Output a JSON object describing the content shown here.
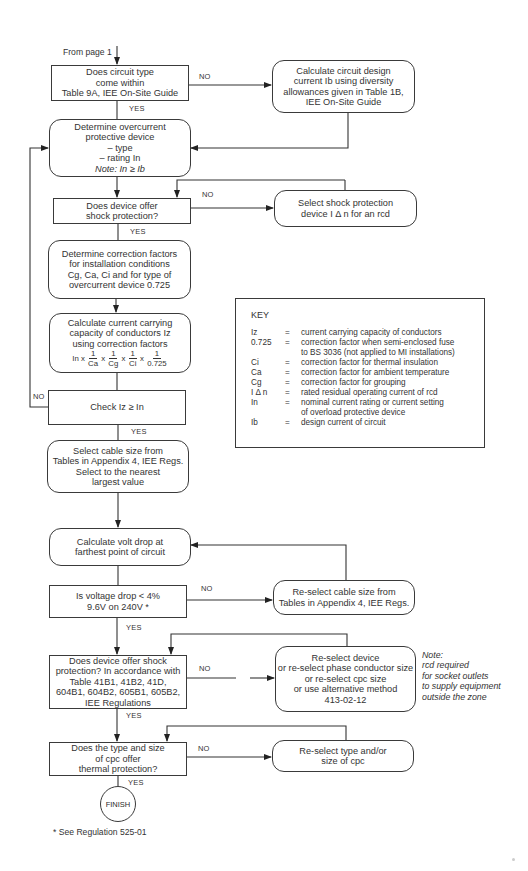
{
  "entry": {
    "label": "From page 1"
  },
  "nodes": {
    "circuit_type": {
      "lines": [
        "Does circuit type",
        "come within",
        "Table 9A, IEE On-Site Guide"
      ]
    },
    "design_current": {
      "lines": [
        "Calculate circuit design",
        "current Ib using diversity",
        "allowances given in Table 1B,",
        "IEE On-Site Guide"
      ]
    },
    "overcurrent": {
      "lines": [
        "Determine overcurrent",
        "protective device",
        "–  type",
        "–  rating  In"
      ],
      "note": "Note: In ≥  Ib"
    },
    "shock_protection": {
      "lines": [
        "Does device offer",
        "shock protection?"
      ]
    },
    "select_rcd": {
      "lines": [
        "Select shock protection",
        "device I  Δ  n for an rcd"
      ]
    },
    "correction_factors": {
      "lines": [
        "Determine correction factors",
        "for installation conditions",
        "Cg, Ca, Ci and for type of",
        "overcurrent device 0.725"
      ]
    },
    "current_capacity": {
      "lines": [
        "Calculate current carrying",
        "capacity of conductors Iz",
        "using correction factors"
      ],
      "formula": {
        "lead": "In",
        "times": "x",
        "numerator": "1",
        "denominators": [
          "Ca",
          "Cg",
          "Ci",
          "0.725"
        ]
      }
    },
    "check": {
      "label": "Check   Iz  ≥  In"
    },
    "select_cable": {
      "lines": [
        "Select cable size from",
        "Tables in Appendix 4, IEE Regs.",
        "Select to the nearest",
        "largest value"
      ]
    },
    "volt_drop": {
      "lines": [
        "Calculate volt drop at",
        "farthest point of circuit"
      ]
    },
    "voltage_check": {
      "lines": [
        "Is voltage drop < 4%",
        "9.6V on 240V *"
      ]
    },
    "reselect_cable": {
      "lines": [
        "Re-select cable size from",
        "Tables in Appendix 4, IEE Regs."
      ]
    },
    "shock_regs": {
      "lines": [
        "Does device offer shock",
        "protection? In accordance with",
        "Table 41B1, 41B2, 41D,",
        "604B1, 604B2, 605B1, 605B2,",
        "IEE Regulations"
      ]
    },
    "reselect_device": {
      "lines": [
        "Re-select device",
        "or re-select phase conductor size",
        "or re-select cpc size",
        "or use alternative method",
        "413-02-12"
      ]
    },
    "cpc_check": {
      "lines": [
        "Does the type and size",
        "of cpc offer",
        "thermal protection?"
      ]
    },
    "reselect_cpc": {
      "lines": [
        "Re-select type and/or",
        "size of cpc"
      ]
    },
    "finish": {
      "label": "FINISH"
    }
  },
  "edge_labels": {
    "yes": "YES",
    "no": "NO"
  },
  "note": {
    "lines": [
      "Note:",
      "rcd required",
      "for socket outlets",
      "to supply equipment",
      "outside the zone"
    ]
  },
  "key": {
    "title": "KEY",
    "rows": [
      {
        "symbol": "Iz",
        "eq": "=",
        "definition": [
          "current carrying capacity of conductors"
        ]
      },
      {
        "symbol": "0.725",
        "eq": "=",
        "definition": [
          "correction factor when semi-enclosed fuse",
          "to BS 3036 (not applied to MI installations)"
        ]
      },
      {
        "symbol": "Ci",
        "eq": "=",
        "definition": [
          "correction factor for thermal insulation"
        ]
      },
      {
        "symbol": "Ca",
        "eq": "=",
        "definition": [
          "correction factor for ambient temperature"
        ]
      },
      {
        "symbol": "Cg",
        "eq": "=",
        "definition": [
          "correction factor for grouping"
        ]
      },
      {
        "symbol": "I Δ n",
        "eq": "=",
        "definition": [
          "rated residual operating current of rcd"
        ]
      },
      {
        "symbol": "In",
        "eq": "=",
        "definition": [
          "nominal current rating or current setting",
          "of overload protective device"
        ]
      },
      {
        "symbol": "Ib",
        "eq": "=",
        "definition": [
          "design current of circuit"
        ]
      }
    ]
  },
  "footnote": "* See Regulation 525-01"
}
